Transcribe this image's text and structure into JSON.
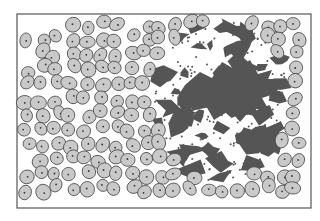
{
  "diagram": {
    "frame": {
      "x": 17,
      "y": 14,
      "width": 294,
      "height": 194,
      "stroke": "#555555"
    },
    "colors": {
      "background": "#ffffff",
      "cell_fill": "#c9c9c9",
      "cell_stroke": "#4a4a4a",
      "nucleus": "#333333",
      "fragment": "#555555",
      "granule": "#555555"
    },
    "regions": [
      {
        "name": "intact-cells",
        "side": "left"
      },
      {
        "name": "fragmented-debris",
        "side": "center-right"
      },
      {
        "name": "intact-cells-border",
        "side": "right and bottom edges"
      }
    ]
  }
}
